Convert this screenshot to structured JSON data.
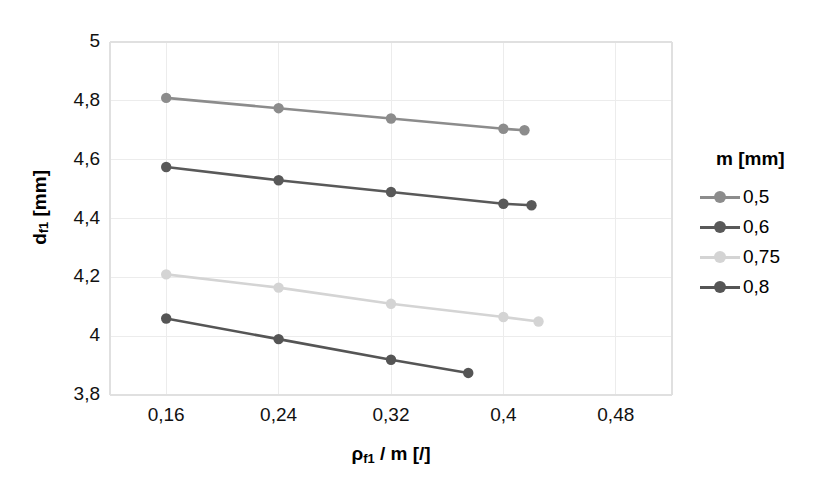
{
  "chart_data": {
    "type": "line",
    "title": "",
    "xlabel": "ρf1 / m [/]",
    "ylabel": "df1 [mm]",
    "xlim": [
      0.12,
      0.52
    ],
    "ylim": [
      3.8,
      5.0
    ],
    "xticks": [
      "0,16",
      "0,24",
      "0,32",
      "0,4",
      "0,48"
    ],
    "xtick_values": [
      0.16,
      0.24,
      0.32,
      0.4,
      0.48
    ],
    "yticks": [
      "5",
      "4,8",
      "4,6",
      "4,4",
      "4,2",
      "4",
      "3,8"
    ],
    "ytick_values": [
      5,
      4.8,
      4.6,
      4.4,
      4.2,
      4,
      3.8
    ],
    "grid": true,
    "legend_position": "right",
    "legend_title": "m [mm]",
    "series": [
      {
        "name": "0,5",
        "color": "#8c8c8c",
        "x": [
          0.16,
          0.24,
          0.32,
          0.4,
          0.415
        ],
        "values": [
          4.81,
          4.775,
          4.74,
          4.705,
          4.7
        ]
      },
      {
        "name": "0,6",
        "color": "#595959",
        "x": [
          0.16,
          0.24,
          0.32,
          0.4,
          0.42
        ],
        "values": [
          4.575,
          4.53,
          4.49,
          4.45,
          4.445
        ]
      },
      {
        "name": "0,75",
        "color": "#d4d4d4",
        "x": [
          0.16,
          0.24,
          0.32,
          0.4,
          0.425
        ],
        "values": [
          4.21,
          4.165,
          4.11,
          4.065,
          4.05
        ]
      },
      {
        "name": "0,8",
        "color": "#555555",
        "x": [
          0.16,
          0.24,
          0.32,
          0.375
        ],
        "values": [
          4.06,
          3.99,
          3.92,
          3.875
        ]
      }
    ]
  },
  "axes": {
    "y_title_main": "d",
    "y_title_sub": "f1",
    "y_title_unit": " [mm]",
    "x_title_main": "ρ",
    "x_title_sub": "f1",
    "x_title_rest": " / m [/]"
  },
  "style": {
    "grid_color": "#ececec",
    "frame_color": "#e0e0e0",
    "text_color": "#111111",
    "background": "#ffffff"
  }
}
